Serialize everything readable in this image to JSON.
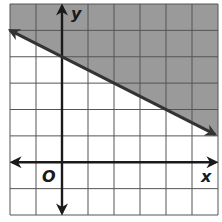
{
  "chart_data": {
    "type": "line",
    "title": "",
    "subtitle": "Graph of linear inequality y > -1/2 x + 4 (shaded above boundary line)",
    "xlabel": "x",
    "ylabel": "y",
    "origin_label": "O",
    "xlim": [
      -2,
      6
    ],
    "ylim": [
      -2,
      6
    ],
    "grid": true,
    "grid_step": 1,
    "tick_labels_shown": false,
    "boundary_line": {
      "slope": -0.5,
      "intercept": 4,
      "style": "solid",
      "points": [
        {
          "x": -2,
          "y": 5
        },
        {
          "x": 0,
          "y": 4
        },
        {
          "x": 6,
          "y": 1
        }
      ]
    },
    "shaded_region": "above line",
    "colors": {
      "shade": "#9a9a9a",
      "grid": "#555555",
      "axis": "#1a1a1a",
      "line": "#333333"
    }
  },
  "labels": {
    "x_axis": "x",
    "y_axis": "y",
    "origin": "O"
  }
}
